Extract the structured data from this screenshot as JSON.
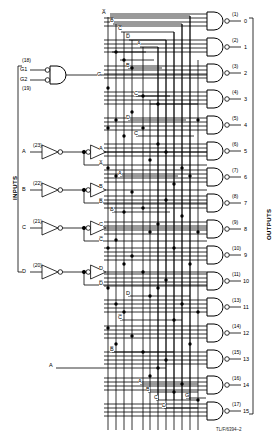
{
  "figure": {
    "caption": "TL/F/6394–2",
    "inputs_label": "INPUTS",
    "outputs_label": "OUTPUTS"
  },
  "enable": {
    "gate_type": "and-gate",
    "output_label": "G",
    "inputs": [
      {
        "name": "G1",
        "pin": "(18)",
        "inverted": true
      },
      {
        "name": "G2",
        "pin": "(19)",
        "inverted": true
      }
    ]
  },
  "data_inputs": [
    {
      "name": "A",
      "pin": "(23)",
      "true_label": "A",
      "comp_label": "A̅"
    },
    {
      "name": "B",
      "pin": "(22)",
      "true_label": "B",
      "comp_label": "B̅"
    },
    {
      "name": "C",
      "pin": "(21)",
      "true_label": "C",
      "comp_label": "C̅"
    },
    {
      "name": "D",
      "pin": "(20)",
      "true_label": "D",
      "comp_label": "D̅"
    }
  ],
  "bus_labels_top": [
    "A̅",
    "B̅",
    "C̅",
    "D̅",
    "A"
  ],
  "bus_labels_mid": [
    "B",
    "C",
    "D",
    "A",
    "B",
    "C"
  ],
  "bus_labels_low": [
    "D",
    "C̅",
    "B̅",
    "A",
    "A",
    "B",
    "C",
    "D",
    "G"
  ],
  "outputs": [
    {
      "index": "0",
      "pin": "(1)"
    },
    {
      "index": "1",
      "pin": "(2)"
    },
    {
      "index": "2",
      "pin": "(3)"
    },
    {
      "index": "3",
      "pin": "(4)"
    },
    {
      "index": "4",
      "pin": "(5)"
    },
    {
      "index": "5",
      "pin": "(6)"
    },
    {
      "index": "6",
      "pin": "(7)"
    },
    {
      "index": "7",
      "pin": "(8)"
    },
    {
      "index": "8",
      "pin": "(9)"
    },
    {
      "index": "9",
      "pin": "(10)"
    },
    {
      "index": "10",
      "pin": "(11)"
    },
    {
      "index": "11",
      "pin": "(13)"
    },
    {
      "index": "12",
      "pin": "(14)"
    },
    {
      "index": "13",
      "pin": "(15)"
    },
    {
      "index": "14",
      "pin": "(16)"
    },
    {
      "index": "15",
      "pin": "(17)"
    }
  ],
  "colors": {
    "ink": "#000000",
    "background": "#ffffff"
  }
}
